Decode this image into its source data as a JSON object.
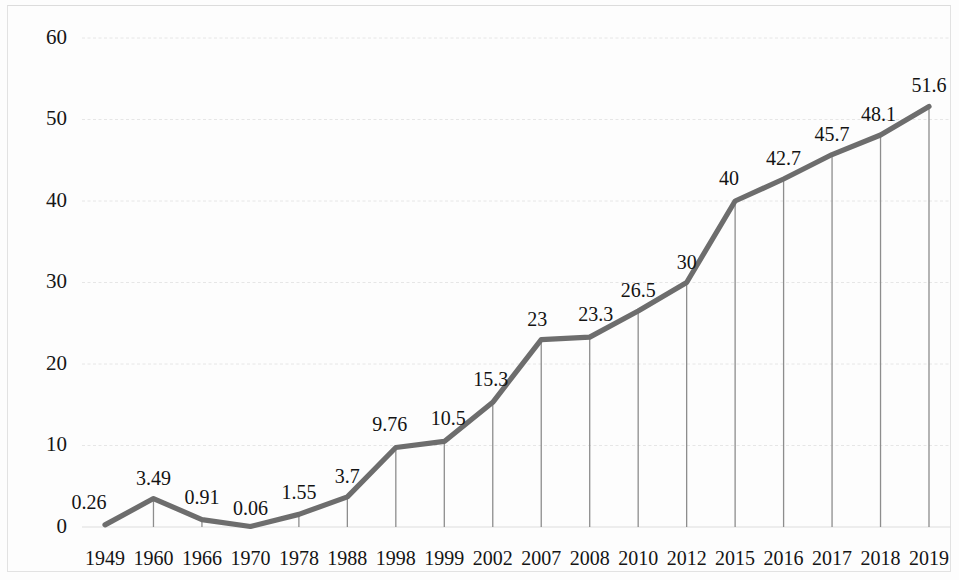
{
  "chart_data": {
    "type": "line",
    "title": "",
    "subtitle": "",
    "xlabel": "",
    "ylabel": "",
    "categories": [
      "1949",
      "1960",
      "1966",
      "1970",
      "1978",
      "1988",
      "1998",
      "1999",
      "2002",
      "2007",
      "2008",
      "2010",
      "2012",
      "2015",
      "2016",
      "2017",
      "2018",
      "2019"
    ],
    "values": [
      0.26,
      3.49,
      0.91,
      0.06,
      1.55,
      3.7,
      9.76,
      10.5,
      15.3,
      23,
      23.3,
      26.5,
      30,
      40,
      42.7,
      45.7,
      48.1,
      51.6
    ],
    "point_labels": [
      "0.26",
      "3.49",
      "0.91",
      "0.06",
      "1.55",
      "3.7",
      "9.76",
      "10.5",
      "15.3",
      "23",
      "23.3",
      "26.5",
      "30",
      "40",
      "42.7",
      "45.7",
      "48.1",
      "51.6"
    ],
    "ylim": [
      0,
      60
    ],
    "y_ticks": [
      0,
      10,
      20,
      30,
      40,
      50,
      60
    ],
    "y_tick_labels": [
      "0",
      "10",
      "20",
      "30",
      "40",
      "50",
      "60"
    ],
    "grid": true,
    "grid_axis": "y",
    "legend": false,
    "legend_position": "none",
    "series": [
      {
        "name": "",
        "values": [
          0.26,
          3.49,
          0.91,
          0.06,
          1.55,
          3.7,
          9.76,
          10.5,
          15.3,
          23,
          23.3,
          26.5,
          30,
          40,
          42.7,
          45.7,
          48.1,
          51.6
        ]
      }
    ],
    "drop_lines": true,
    "colors": {
      "line": "#6d6d6d",
      "grid": "#e6e6e6",
      "drop_line": "#8d8d8d",
      "text": "#131313",
      "background": "#fdfdfd"
    }
  }
}
